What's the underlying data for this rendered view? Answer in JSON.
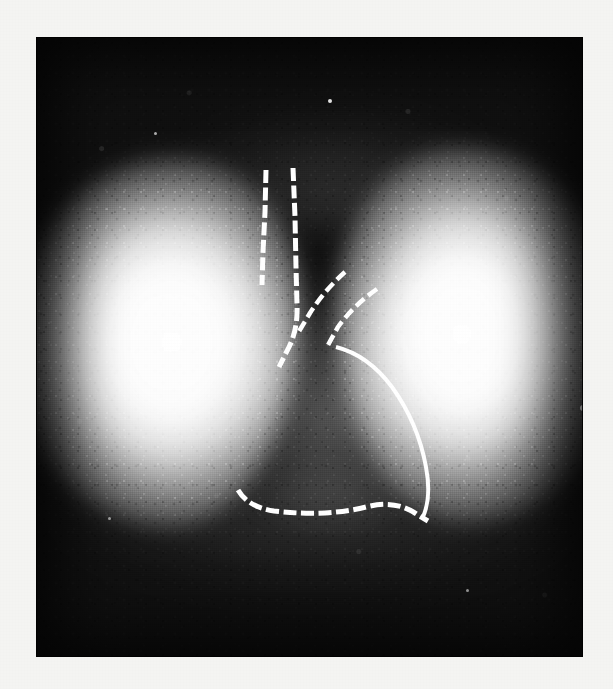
{
  "figure": {
    "modality": "lung-perfusion-scintigram",
    "view": "anterior",
    "plate": {
      "x": 36,
      "y": 37,
      "width": 547,
      "height": 620,
      "background_color": "#101010",
      "page_background_color": "#f4f4f2"
    },
    "intensity_scale": {
      "hot_color": "#ffffff",
      "mid_color": "#8e8e8e",
      "cold_color": "#101010"
    },
    "regions": [
      {
        "name": "right-lung-field",
        "label": "right lung field",
        "side": "image-left",
        "uptake": "high",
        "appearance": "bright-white"
      },
      {
        "name": "left-lung-field",
        "label": "left lung field",
        "side": "image-right",
        "uptake": "high",
        "appearance": "bright-white"
      },
      {
        "name": "mediastinum",
        "label": "mediastinum",
        "uptake": "low",
        "appearance": "dark-central-band"
      },
      {
        "name": "cardiac-silhouette",
        "label": "cardiac silhouette",
        "uptake": "absent",
        "appearance": "photopenic"
      }
    ],
    "overlay": {
      "stroke_color": "#ffffff",
      "style": "dashed",
      "tracings": [
        {
          "name": "trachea-right-wall",
          "label": "trachea right wall",
          "style": "dashed",
          "d": "M 230 133 L 229 175 L 227 215 L 226 248"
        },
        {
          "name": "trachea-left-wall",
          "label": "trachea left wall",
          "style": "dashed",
          "d": "M 257 131 L 259 180 L 260 230 L 261 268 Q 262 292 253 310 L 243 330"
        },
        {
          "name": "left-main-bronchus",
          "label": "left main bronchus upper margin",
          "style": "dashed",
          "d": "M 309 235 Q 288 254 274 276 L 262 296"
        },
        {
          "name": "left-main-bronchus-lower",
          "label": "left main bronchus lower margin",
          "style": "dashed",
          "d": "M 341 252 Q 318 268 302 290 L 292 308"
        },
        {
          "name": "cardiac-left-border",
          "label": "cardiac left border",
          "style": "solid-dashed",
          "d": "M 300 310 Q 332 318 356 350 Q 382 386 390 430 Q 396 462 386 482"
        },
        {
          "name": "diaphragm-border",
          "label": "diaphragm / cardiac inferior border",
          "style": "dashed",
          "d": "M 202 453 Q 212 470 238 474 Q 290 480 330 470 Q 360 462 382 478 L 392 484"
        }
      ]
    },
    "specks": [
      {
        "x": 544,
        "y": 368,
        "r": 3
      },
      {
        "x": 292,
        "y": 62,
        "r": 2
      },
      {
        "x": 118,
        "y": 95,
        "r": 1.5
      },
      {
        "x": 430,
        "y": 552,
        "r": 1.5
      },
      {
        "x": 72,
        "y": 480,
        "r": 1.5
      }
    ]
  }
}
